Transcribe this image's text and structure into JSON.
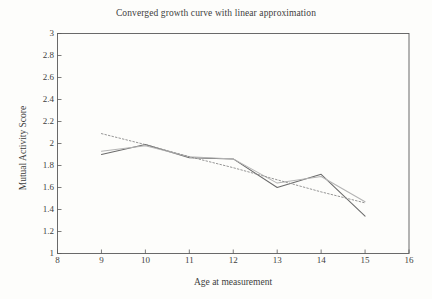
{
  "chart_data": {
    "type": "line",
    "title": "Converged growth curve with linear approximation",
    "xlabel": "Age at measurement",
    "ylabel": "Mutual Activity Score",
    "xlim": [
      8,
      16
    ],
    "ylim": [
      1,
      3
    ],
    "grid": false,
    "legend_position": "none",
    "xticks": [
      "8",
      "9",
      "10",
      "11",
      "12",
      "13",
      "14",
      "15",
      "16"
    ],
    "xtick_values": [
      8,
      9,
      10,
      11,
      12,
      13,
      14,
      15,
      16
    ],
    "yticks": [
      "1",
      "1.2",
      "1.4",
      "1.6",
      "1.8",
      "2",
      "2.2",
      "2.4",
      "2.6",
      "2.8",
      "3"
    ],
    "ytick_values": [
      1,
      1.2,
      1.4,
      1.6,
      1.8,
      2,
      2.2,
      2.4,
      2.6,
      2.8,
      3
    ],
    "x": [
      9,
      10,
      11,
      12,
      13,
      14,
      15
    ],
    "series": [
      {
        "name": "Observed growth curve",
        "style": "solid",
        "color": "#6b6b6b",
        "values": [
          1.9,
          1.99,
          1.87,
          1.86,
          1.6,
          1.72,
          1.34
        ]
      },
      {
        "name": "Converged growth curve",
        "style": "solid",
        "color": "#b4b4b4",
        "values": [
          1.93,
          1.98,
          1.88,
          1.86,
          1.64,
          1.7,
          1.47
        ]
      },
      {
        "name": "Linear approximation",
        "style": "dotted",
        "color": "#8a8a8a",
        "values": [
          2.09,
          1.99,
          1.88,
          1.78,
          1.67,
          1.56,
          1.46
        ]
      }
    ]
  },
  "figure": {
    "caption_fragment": ""
  }
}
